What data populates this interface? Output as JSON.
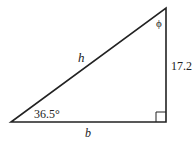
{
  "diagram": {
    "type": "right-triangle",
    "stroke_color": "#222222",
    "background": "#ffffff",
    "vertices": {
      "bottom_left": [
        11,
        122
      ],
      "bottom_right": [
        166,
        122
      ],
      "top_right": [
        166,
        8
      ]
    },
    "labels": {
      "hypotenuse": "h",
      "base": "b",
      "vertical_side": "17.2",
      "base_angle": "36.5°",
      "top_angle": "ϕ"
    },
    "right_angle_marker": true
  }
}
